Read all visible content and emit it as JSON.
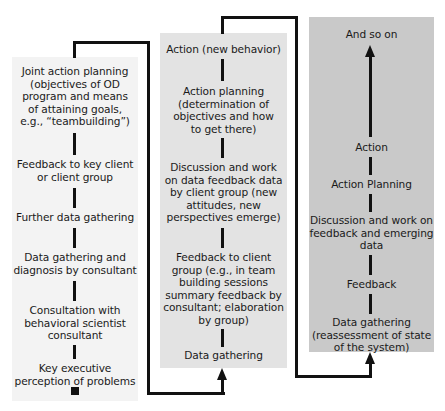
{
  "diagram": {
    "type": "flowchart",
    "colors": {
      "panel_1": "#f3f3f3",
      "panel_2": "#e3e3e3",
      "panel_3": "#c9c9c9",
      "lines": "#111111"
    },
    "panels": [
      {
        "steps_top_to_bottom": [
          "Joint action planning (objectives of OD program and means of attaining goals, e.g., “teambuilding”)",
          "Feedback to key client or client group",
          "Further data gathering",
          "Data gathering and diagnosis by consultant",
          "Consultation with behavioral scientist consultant",
          "Key executive perception of problems"
        ],
        "lines": {
          "s0": [
            "Joint action planning",
            "(objectives of OD",
            "program and means",
            "of attaining goals,",
            "e.g., “teambuilding”)"
          ],
          "s1": [
            "Feedback to key client",
            "or client group"
          ],
          "s2": [
            "Further data gathering"
          ],
          "s3": [
            "Data gathering and",
            "diagnosis by consultant"
          ],
          "s4": [
            "Consultation with",
            "behavioral scientist",
            "consultant"
          ],
          "s5": [
            "Key executive",
            "perception of problems"
          ]
        }
      },
      {
        "steps_top_to_bottom": [
          "Action (new behavior)",
          "Action planning (determination of objectives and how to get there)",
          "Discussion and work on data feedback data by client group (new attitudes, new perspectives emerge)",
          "Feedback to client group (e.g., in team building sessions summary feedback by consultant; elaboration by group)",
          "Data gathering"
        ],
        "lines": {
          "s0": [
            "Action (new behavior)"
          ],
          "s1": [
            "Action planning",
            "(determination of",
            "objectives and how",
            "to get there)"
          ],
          "s2": [
            "Discussion and work",
            "on data feedback data",
            "by client group (new",
            "attitudes, new",
            "perspectives emerge)"
          ],
          "s3": [
            "Feedback to client",
            "group (e.g., in team",
            "building sessions",
            "summary feedback by",
            "consultant; elaboration",
            "by group)"
          ],
          "s4": [
            "Data gathering"
          ]
        }
      },
      {
        "steps_top_to_bottom": [
          "And so on",
          "Action",
          "Action Planning",
          "Discussion and work on feedback and emerging data",
          "Feedback",
          "Data gathering (reassessment of state of the system)"
        ],
        "lines": {
          "s0": [
            "And so on"
          ],
          "s1": [
            "Action"
          ],
          "s2": [
            "Action Planning"
          ],
          "s3": [
            "Discussion and work on",
            "feedback and emerging",
            "data"
          ],
          "s4": [
            "Feedback"
          ],
          "s5": [
            "Data gathering",
            "(reassessment of state",
            "of the system)"
          ]
        }
      }
    ]
  }
}
